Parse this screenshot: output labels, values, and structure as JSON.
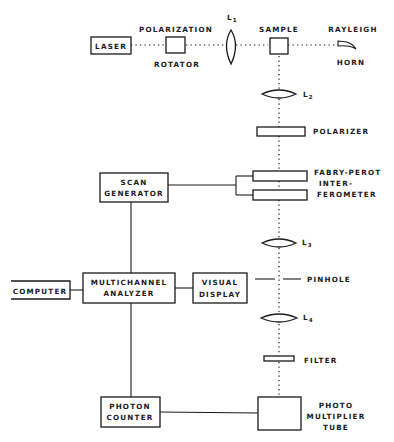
{
  "diagram": {
    "type": "block-diagram",
    "beam_path": [
      "LASER",
      "POLARIZATION ROTATOR",
      "L1",
      "SAMPLE",
      "L2",
      "POLARIZER",
      "FABRY-PEROT INTERFEROMETER",
      "L3",
      "PINHOLE",
      "L4",
      "FILTER",
      "PHOTO MULTIPLIER TUBE"
    ],
    "components": {
      "laser": "LASER",
      "polarization_rotator": {
        "line1": "POLARIZATION",
        "line2": "ROTATOR"
      },
      "lens1": {
        "letter": "L",
        "sub": "1"
      },
      "sample": "SAMPLE",
      "rayleigh_horn": {
        "line1": "RAYLEIGH",
        "line2": "HORN"
      },
      "lens2": {
        "letter": "L",
        "sub": "2"
      },
      "polarizer": "POLARIZER",
      "fabry_perot": {
        "line1": "FABRY-PEROT",
        "line2": "INTER-",
        "line3": "FEROMETER"
      },
      "scan_generator": {
        "line1": "SCAN",
        "line2": "GENERATOR"
      },
      "lens3": {
        "letter": "L",
        "sub": "3"
      },
      "pinhole": "PINHOLE",
      "computer": "COMPUTER",
      "multichannel_analyzer": {
        "line1": "MULTICHANNEL",
        "line2": "ANALYZER"
      },
      "visual_display": {
        "line1": "VISUAL",
        "line2": "DISPLAY"
      },
      "lens4": {
        "letter": "L",
        "sub": "4"
      },
      "filter": "FILTER",
      "photon_counter": {
        "line1": "PHOTON",
        "line2": "COUNTER"
      },
      "pmt": {
        "line1": "PHOTO",
        "line2": "MULTIPLIER",
        "line3": "TUBE"
      }
    },
    "connections": [
      [
        "SCAN GENERATOR",
        "FABRY-PEROT INTERFEROMETER"
      ],
      [
        "SCAN GENERATOR",
        "MULTICHANNEL ANALYZER"
      ],
      [
        "COMPUTER",
        "MULTICHANNEL ANALYZER"
      ],
      [
        "MULTICHANNEL ANALYZER",
        "VISUAL DISPLAY"
      ],
      [
        "MULTICHANNEL ANALYZER",
        "PHOTON COUNTER"
      ],
      [
        "PHOTON COUNTER",
        "PHOTO MULTIPLIER TUBE"
      ]
    ]
  }
}
